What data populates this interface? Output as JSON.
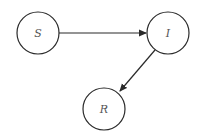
{
  "diagram": {
    "type": "directed-graph",
    "nodes": [
      {
        "id": "S",
        "label": "S"
      },
      {
        "id": "I",
        "label": "I"
      },
      {
        "id": "R",
        "label": "R"
      }
    ],
    "edges": [
      {
        "from": "S",
        "to": "I"
      },
      {
        "from": "I",
        "to": "R"
      }
    ],
    "colors": {
      "stroke": "#2a2a2a",
      "label": "#555555",
      "background": "#ffffff"
    }
  }
}
